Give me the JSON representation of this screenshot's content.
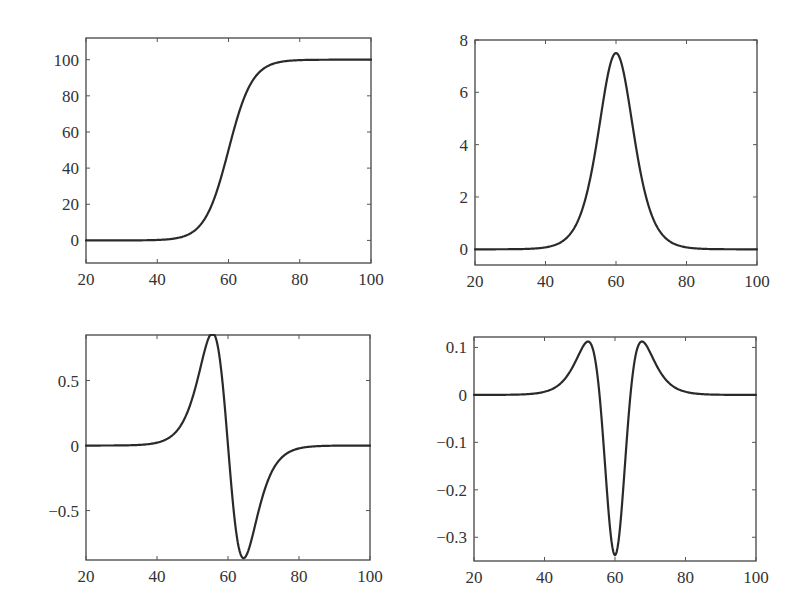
{
  "figure": {
    "layout": "2x2 subplots",
    "line_color": "#2a2a2a",
    "axis_color": "#444444"
  },
  "chart_data": [
    {
      "id": "top-left",
      "type": "line",
      "title": "",
      "xlabel": "",
      "ylabel": "",
      "description": "Sigmoid (logistic) curve rising from 0 to 100 centered at x=60",
      "xlim": [
        20,
        100
      ],
      "ylim": [
        -12.5,
        112
      ],
      "xticks": [
        20,
        40,
        60,
        80,
        100
      ],
      "xtick_labels": [
        "20",
        "40",
        "60",
        "80",
        "100"
      ],
      "yticks": [
        0,
        20,
        40,
        60,
        80,
        100
      ],
      "ytick_labels": [
        "0",
        "20",
        "40",
        "60",
        "80",
        "100"
      ],
      "grid": false,
      "x": [
        20,
        30,
        40,
        45,
        50,
        52,
        54,
        56,
        58,
        60,
        62,
        64,
        66,
        68,
        70,
        75,
        80,
        90,
        100
      ],
      "values": [
        0.0,
        0.0,
        0.2,
        1.1,
        4.7,
        8.3,
        14.2,
        23.2,
        35.4,
        50.0,
        64.6,
        76.8,
        85.8,
        91.7,
        95.3,
        98.9,
        99.8,
        100.0,
        100.0
      ],
      "model": {
        "kind": "logistic",
        "amplitude": 100,
        "center": 60,
        "scale": 3.333,
        "derivative": 0
      },
      "box": {
        "left": 86,
        "top": 38,
        "right": 371,
        "bottom": 263
      }
    },
    {
      "id": "top-right",
      "type": "line",
      "title": "",
      "xlabel": "",
      "ylabel": "",
      "description": "First derivative: bell-shaped peak of ~7.5 at x=60",
      "xlim": [
        20,
        100
      ],
      "ylim": [
        -0.6,
        8
      ],
      "xticks": [
        20,
        40,
        60,
        80,
        100
      ],
      "xtick_labels": [
        "20",
        "40",
        "60",
        "80",
        "100"
      ],
      "yticks": [
        0,
        2,
        4,
        6,
        8
      ],
      "ytick_labels": [
        "0",
        "2",
        "4",
        "6",
        "8"
      ],
      "grid": false,
      "x": [
        20,
        30,
        40,
        45,
        50,
        52,
        54,
        56,
        58,
        60,
        62,
        64,
        66,
        68,
        70,
        75,
        80,
        90,
        100
      ],
      "values": [
        0.0,
        0.0,
        0.04,
        0.33,
        1.34,
        2.28,
        3.65,
        5.34,
        6.86,
        7.5,
        6.86,
        5.34,
        3.65,
        2.28,
        1.34,
        0.33,
        0.04,
        0.0,
        0.0
      ],
      "model": {
        "kind": "logistic",
        "amplitude": 100,
        "center": 60,
        "scale": 3.333,
        "derivative": 1
      },
      "box": {
        "left": 475,
        "top": 40,
        "right": 757,
        "bottom": 265
      }
    },
    {
      "id": "bottom-left",
      "type": "line",
      "title": "",
      "xlabel": "",
      "ylabel": "",
      "description": "Second derivative: positive lobe ~0.87 near x=56, negative lobe ~-0.87 near x=64",
      "xlim": [
        20,
        100
      ],
      "ylim": [
        -0.88,
        0.85
      ],
      "xticks": [
        20,
        40,
        60,
        80,
        100
      ],
      "xtick_labels": [
        "20",
        "40",
        "60",
        "80",
        "100"
      ],
      "yticks": [
        -0.5,
        0,
        0.5
      ],
      "ytick_labels": [
        "−0.5",
        "0",
        "0.5"
      ],
      "grid": false,
      "x": [
        20,
        30,
        40,
        45,
        50,
        52,
        54,
        55.6,
        58,
        60,
        62,
        64.4,
        66,
        68,
        70,
        75,
        80,
        90,
        100
      ],
      "values": [
        0.0,
        0.0,
        0.01,
        0.1,
        0.36,
        0.57,
        0.78,
        0.87,
        0.58,
        0.0,
        -0.58,
        -0.87,
        -0.78,
        -0.57,
        -0.36,
        -0.1,
        -0.01,
        0.0,
        0.0
      ],
      "model": {
        "kind": "logistic",
        "amplitude": 100,
        "center": 60,
        "scale": 3.333,
        "derivative": 2
      },
      "box": {
        "left": 86,
        "top": 335,
        "right": 370,
        "bottom": 560
      }
    },
    {
      "id": "bottom-right",
      "type": "line",
      "title": "",
      "xlabel": "",
      "ylabel": "",
      "description": "Third derivative: side peaks ~0.11 at x≈52.4 and 67.6, central trough ~-0.34 at x=60",
      "xlim": [
        20,
        100
      ],
      "ylim": [
        -0.35,
        0.122
      ],
      "xticks": [
        20,
        40,
        60,
        80,
        100
      ],
      "xtick_labels": [
        "20",
        "40",
        "60",
        "80",
        "100"
      ],
      "yticks": [
        -0.3,
        -0.2,
        -0.1,
        0,
        0.1
      ],
      "ytick_labels": [
        "−0.3",
        "−0.2",
        "−0.1",
        "0",
        "0.1"
      ],
      "grid": false,
      "x": [
        20,
        30,
        40,
        45,
        48,
        50,
        52.4,
        54,
        56,
        58,
        60,
        62,
        64,
        66,
        67.6,
        70,
        72,
        75,
        80,
        90,
        100
      ],
      "values": [
        0.0,
        0.0,
        0.0,
        0.03,
        0.06,
        0.09,
        0.111,
        0.1,
        0.02,
        -0.19,
        -0.338,
        -0.19,
        0.02,
        0.1,
        0.111,
        0.09,
        0.06,
        0.03,
        0.0,
        0.0,
        0.0
      ],
      "model": {
        "kind": "logistic",
        "amplitude": 100,
        "center": 60,
        "scale": 3.333,
        "derivative": 3
      },
      "box": {
        "left": 474,
        "top": 337,
        "right": 756,
        "bottom": 561
      }
    }
  ]
}
